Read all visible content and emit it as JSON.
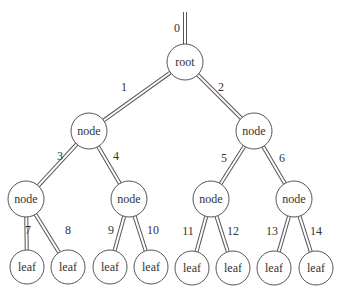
{
  "diagram": {
    "type": "binary-tree",
    "root_edge": {
      "label": "0",
      "x1": 185,
      "y1": 12,
      "x2": 185,
      "y2": 44,
      "lx": 177,
      "ly": 28
    },
    "nodes": [
      {
        "id": "root",
        "label": "root",
        "cx": 185,
        "cy": 62,
        "r": 18
      },
      {
        "id": "n1",
        "label": "node",
        "cx": 89,
        "cy": 131,
        "r": 18
      },
      {
        "id": "n2",
        "label": "node",
        "cx": 254,
        "cy": 131,
        "r": 18
      },
      {
        "id": "n3",
        "label": "node",
        "cx": 26,
        "cy": 199,
        "r": 18
      },
      {
        "id": "n4",
        "label": "node",
        "cx": 129,
        "cy": 199,
        "r": 18
      },
      {
        "id": "n5",
        "label": "node",
        "cx": 211,
        "cy": 199,
        "r": 18
      },
      {
        "id": "n6",
        "label": "node",
        "cx": 294,
        "cy": 199,
        "r": 18
      },
      {
        "id": "l7",
        "label": "leaf",
        "cx": 27,
        "cy": 267,
        "r": 17
      },
      {
        "id": "l8",
        "label": "leaf",
        "cx": 68,
        "cy": 267,
        "r": 17
      },
      {
        "id": "l9",
        "label": "leaf",
        "cx": 110,
        "cy": 267,
        "r": 17
      },
      {
        "id": "l10",
        "label": "leaf",
        "cx": 151,
        "cy": 267,
        "r": 17
      },
      {
        "id": "l11",
        "label": "leaf",
        "cx": 192,
        "cy": 268,
        "r": 17
      },
      {
        "id": "l12",
        "label": "leaf",
        "cx": 233,
        "cy": 268,
        "r": 17
      },
      {
        "id": "l13",
        "label": "leaf",
        "cx": 274,
        "cy": 268,
        "r": 17
      },
      {
        "id": "l14",
        "label": "leaf",
        "cx": 316,
        "cy": 268,
        "r": 17
      }
    ],
    "edges": [
      {
        "label": "1",
        "from": "root",
        "to": "n1",
        "lx": 124,
        "ly": 87
      },
      {
        "label": "2",
        "from": "root",
        "to": "n2",
        "lx": 221,
        "ly": 87
      },
      {
        "label": "3",
        "from": "n1",
        "to": "n3",
        "lx": 60,
        "ly": 156
      },
      {
        "label": "4",
        "from": "n1",
        "to": "n4",
        "lx": 116,
        "ly": 156
      },
      {
        "label": "5",
        "from": "n2",
        "to": "n5",
        "lx": 224,
        "ly": 158
      },
      {
        "label": "6",
        "from": "n2",
        "to": "n6",
        "lx": 282,
        "ly": 158
      },
      {
        "label": "7",
        "from": "n3",
        "to": "l7",
        "lx": 28,
        "ly": 230
      },
      {
        "label": "8",
        "from": "n3",
        "to": "l8",
        "lx": 68,
        "ly": 230
      },
      {
        "label": "9",
        "from": "n4",
        "to": "l9",
        "lx": 111,
        "ly": 230
      },
      {
        "label": "10",
        "from": "n4",
        "to": "l10",
        "lx": 153,
        "ly": 230
      },
      {
        "label": "11",
        "from": "n5",
        "to": "l11",
        "lx": 188,
        "ly": 231
      },
      {
        "label": "12",
        "from": "n5",
        "to": "l12",
        "lx": 233,
        "ly": 231
      },
      {
        "label": "13",
        "from": "n6",
        "to": "l13",
        "lx": 272,
        "ly": 231
      },
      {
        "label": "14",
        "from": "n6",
        "to": "l14",
        "lx": 316,
        "ly": 231
      }
    ]
  }
}
